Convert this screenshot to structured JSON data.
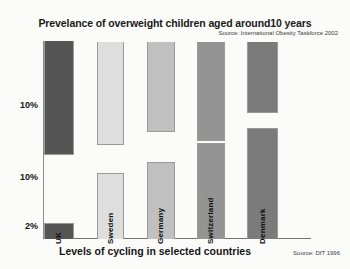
{
  "chart_data": {
    "type": "bar",
    "title": "Prevelance of overweight children aged around10 years",
    "source_top": "Source: International Obesity Taskforce 2002",
    "xlabel": "Levels of cycling in selected countries",
    "source_bottom": "Source: DfT 1996",
    "ylabel": "",
    "grid": false,
    "legend": "none",
    "orientation": "vertical",
    "categories": [
      "UK",
      "Sweden",
      "Germany",
      "Switzerland",
      "Denmark"
    ],
    "ytick_labels": [
      "10%",
      "10%",
      "2%"
    ],
    "yticks": [
      {
        "label": "10%",
        "y_px": 106
      },
      {
        "label": "10%",
        "y_px": 178
      },
      {
        "label": "2%",
        "y_px": 227
      }
    ],
    "series": [
      {
        "name": "Prevalence of overweight children (top bars)",
        "values": [
          20,
          18,
          15,
          17,
          12
        ],
        "bars": [
          {
            "category": "UK",
            "x_px": 44,
            "w_px": 30,
            "top_px": 0,
            "height_px": 114,
            "color": "#555555"
          },
          {
            "category": "Sweden",
            "x_px": 97,
            "w_px": 27,
            "top_px": 1,
            "height_px": 103,
            "color": "#dedede"
          },
          {
            "category": "Germany",
            "x_px": 147,
            "w_px": 28,
            "top_px": 1,
            "height_px": 90,
            "color": "#c0c0c0"
          },
          {
            "category": "Switzerland",
            "x_px": 197,
            "w_px": 28,
            "top_px": 1,
            "height_px": 99,
            "color": "#949494"
          },
          {
            "category": "Denmark",
            "x_px": 247,
            "w_px": 31,
            "top_px": 1,
            "height_px": 71,
            "color": "#7b7b7b"
          }
        ]
      },
      {
        "name": "Levels of cycling (bottom bars)",
        "values": [
          2,
          10,
          12,
          15,
          18
        ],
        "bars": [
          {
            "category": "UK",
            "x_px": 44,
            "w_px": 30,
            "bottom_px": 0,
            "height_px": 16,
            "color": "#555555"
          },
          {
            "category": "Sweden",
            "x_px": 97,
            "w_px": 27,
            "bottom_px": 0,
            "height_px": 66,
            "color": "#dedede"
          },
          {
            "category": "Germany",
            "x_px": 147,
            "w_px": 28,
            "bottom_px": 0,
            "height_px": 77,
            "color": "#c0c0c0"
          },
          {
            "category": "Switzerland",
            "x_px": 197,
            "w_px": 28,
            "bottom_px": 0,
            "height_px": 96,
            "color": "#949494"
          },
          {
            "category": "Denmark",
            "x_px": 247,
            "w_px": 31,
            "bottom_px": 0,
            "height_px": 111,
            "color": "#7b7b7b"
          }
        ]
      }
    ],
    "colors": {
      "uk": "#555555",
      "sweden": "#dedede",
      "germany": "#c0c0c0",
      "switzerland": "#949494",
      "denmark": "#7b7b7b",
      "axis": "#6f6f6f",
      "background": "#fbfbfa",
      "text": "#141414"
    }
  }
}
